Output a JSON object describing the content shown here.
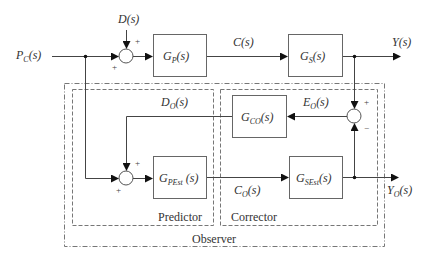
{
  "diagram": {
    "inputs": {
      "pc": {
        "main": "P",
        "sub": "C",
        "arg": "(s)"
      },
      "d": {
        "main": "D(s)"
      }
    },
    "outputs": {
      "y": {
        "main": "Y(s)"
      },
      "yo": {
        "main": "Y",
        "sub": "O",
        "arg": "(s)"
      }
    },
    "signals": {
      "c": {
        "main": "C(s)"
      },
      "eo": {
        "main": "E",
        "sub": "O",
        "arg": "(s)"
      },
      "do": {
        "main": "D",
        "sub": "O",
        "arg": "(s)"
      },
      "co": {
        "main": "C",
        "sub": "O",
        "arg": "(s)"
      }
    },
    "blocks": {
      "gp": {
        "main": "G",
        "sub": "P",
        "arg": "(s)"
      },
      "gs": {
        "main": "G",
        "sub": "S",
        "arg": "(s)"
      },
      "gco": {
        "main": "G",
        "sub": "CO",
        "arg": "(s)"
      },
      "gpest": {
        "main": "G",
        "sub": "PEst",
        "arg": " (s)"
      },
      "gsest": {
        "main": "G",
        "sub": "SEst",
        "arg": "(s)"
      }
    },
    "signs": {
      "sum1_top": "+",
      "sum1_left": "+",
      "sum2_top": "+",
      "sum2_left": "+",
      "sum3_top": "+",
      "sum3_bottom": "−"
    },
    "groups": {
      "predictor": "Predictor",
      "corrector": "Corrector",
      "observer": "Observer"
    }
  }
}
